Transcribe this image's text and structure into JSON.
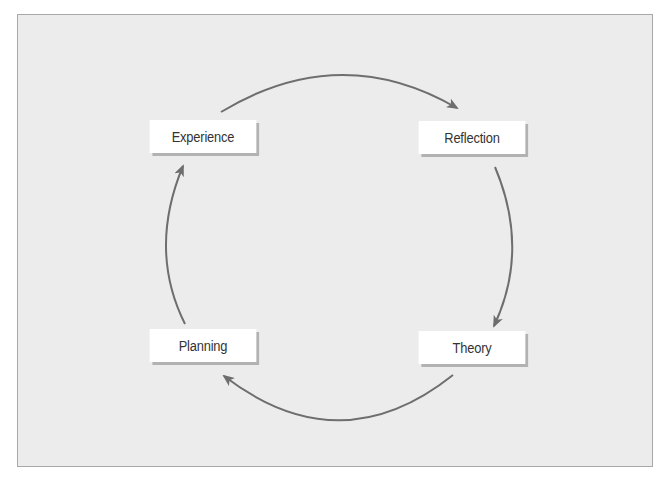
{
  "diagram": {
    "type": "cycle",
    "nodes": [
      {
        "id": "experience",
        "label": "Experience"
      },
      {
        "id": "reflection",
        "label": "Reflection"
      },
      {
        "id": "theory",
        "label": "Theory"
      },
      {
        "id": "planning",
        "label": "Planning"
      }
    ],
    "edges": [
      {
        "from": "experience",
        "to": "reflection"
      },
      {
        "from": "reflection",
        "to": "theory"
      },
      {
        "from": "theory",
        "to": "planning"
      },
      {
        "from": "planning",
        "to": "experience"
      }
    ],
    "colors": {
      "background": "#ececec",
      "border": "#a8a8a8",
      "node_fill": "#ffffff",
      "node_shadow": "#b2b2b2",
      "arrow": "#6e6e6e",
      "text": "#333333"
    }
  }
}
